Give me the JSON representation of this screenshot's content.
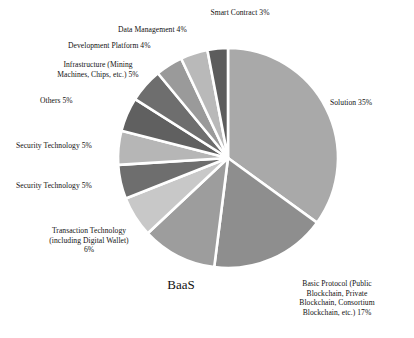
{
  "chart_data": {
    "type": "pie",
    "title": "",
    "subtitle": "",
    "xlabel": "",
    "ylabel": "",
    "legend_position": "none",
    "grid": false,
    "units": "percent",
    "start_angle_deg": 0,
    "direction": "clockwise",
    "categories": [
      "Solution",
      "Basic Protocol (Public Blockchain, Private Blockchain, Consortium Blockchain, etc.)",
      "BaaS",
      "Transaction Technology (including Digital Wallet)",
      "Security Technology",
      "Security Technology",
      "Others",
      "Infrastructure (Mining Machines, Chips, etc.)",
      "Development Platform",
      "Data Management",
      "Smart Contract"
    ],
    "values": [
      35,
      17,
      11,
      6,
      5,
      5,
      5,
      5,
      4,
      4,
      3
    ],
    "colors": [
      "#a9a9a9",
      "#8e8e8e",
      "#9d9d9d",
      "#c8c8c8",
      "#6e6e6e",
      "#b6b6b6",
      "#606060",
      "#6e6e6e",
      "#9a9a9a",
      "#b9b9b9",
      "#5c5c5c"
    ],
    "slices": [
      {
        "name": "Solution",
        "value": 35,
        "label": "Solution 35%",
        "color": "#a9a9a9",
        "start_deg": 0,
        "end_deg": 126
      },
      {
        "name": "Basic Protocol",
        "value": 17,
        "label": "Basic Protocol (Public\nBlockchain, Private\nBlockchain, Consortium\nBlockchain, etc.) 17%",
        "color": "#8e8e8e",
        "start_deg": 126,
        "end_deg": 187.2
      },
      {
        "name": "BaaS",
        "value": 11,
        "label": "BaaS",
        "color": "#9d9d9d",
        "start_deg": 187.2,
        "end_deg": 226.8
      },
      {
        "name": "Transaction Technology",
        "value": 6,
        "label": "Transaction Technology\n(including Digital Wallet)\n6%",
        "color": "#c8c8c8",
        "start_deg": 226.8,
        "end_deg": 248.4
      },
      {
        "name": "Security Technology A",
        "value": 5,
        "label": "Security Technology 5%",
        "color": "#6e6e6e",
        "start_deg": 248.4,
        "end_deg": 266.4
      },
      {
        "name": "Security Technology B",
        "value": 5,
        "label": "Security Technology 5%",
        "color": "#b6b6b6",
        "start_deg": 266.4,
        "end_deg": 284.4
      },
      {
        "name": "Others",
        "value": 5,
        "label": "Others 5%",
        "color": "#606060",
        "start_deg": 284.4,
        "end_deg": 302.4
      },
      {
        "name": "Infrastructure",
        "value": 5,
        "label": "Infrastructure (Mining\nMachines, Chips, etc.) 5%",
        "color": "#6e6e6e",
        "start_deg": 302.4,
        "end_deg": 320.4
      },
      {
        "name": "Development Platform",
        "value": 4,
        "label": "Development Platform 4%",
        "color": "#9a9a9a",
        "start_deg": 320.4,
        "end_deg": 334.8
      },
      {
        "name": "Data Management",
        "value": 4,
        "label": "Data Management 4%",
        "color": "#b9b9b9",
        "start_deg": 334.8,
        "end_deg": 349.2
      },
      {
        "name": "Smart Contract",
        "value": 3,
        "label": "Smart Contract 3%",
        "color": "#5c5c5c",
        "start_deg": 349.2,
        "end_deg": 360
      }
    ]
  },
  "labels": {
    "smart_contract": "Smart Contract 3%",
    "data_management": "Data Management 4%",
    "development_platform": "Development Platform 4%",
    "infrastructure": "Infrastructure (Mining\nMachines, Chips, etc.) 5%",
    "others": "Others 5%",
    "security_technology_1": "Security Technology 5%",
    "security_technology_2": "Security Technology 5%",
    "transaction_technology": "Transaction Technology\n(including Digital Wallet)\n6%",
    "baas": "BaaS",
    "basic_protocol": "Basic Protocol (Public\nBlockchain, Private\nBlockchain, Consortium\nBlockchain, etc.) 17%",
    "solution": "Solution 35%"
  },
  "style": {
    "background": "#ffffff",
    "slice_gap_color": "#ffffff",
    "text_color": "#111111"
  }
}
